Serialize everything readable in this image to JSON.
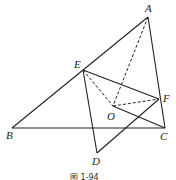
{
  "figure": {
    "caption": "图 1-94",
    "points": {
      "A": {
        "label": "A",
        "x": 148,
        "y": 17,
        "lx": 145,
        "ly": 12
      },
      "B": {
        "label": "B",
        "x": 12,
        "y": 128,
        "lx": 6,
        "ly": 139
      },
      "C": {
        "label": "C",
        "x": 165,
        "y": 128,
        "lx": 160,
        "ly": 140
      },
      "D": {
        "label": "D",
        "x": 97,
        "y": 153,
        "lx": 92,
        "ly": 165
      },
      "E": {
        "label": "E",
        "x": 83,
        "y": 70,
        "lx": 74,
        "ly": 68
      },
      "F": {
        "label": "F",
        "x": 159,
        "y": 99,
        "lx": 163,
        "ly": 102
      },
      "O": {
        "label": "O",
        "x": 113,
        "y": 106,
        "lx": 107,
        "ly": 120
      }
    },
    "solid_segments": [
      [
        "A",
        "B"
      ],
      [
        "B",
        "C"
      ],
      [
        "A",
        "C"
      ],
      [
        "E",
        "F"
      ],
      [
        "O",
        "C"
      ],
      [
        "E",
        "D"
      ],
      [
        "D",
        "F"
      ]
    ],
    "dashed_segments": [
      [
        "E",
        "O"
      ],
      [
        "A",
        "O"
      ],
      [
        "O",
        "F"
      ]
    ]
  }
}
